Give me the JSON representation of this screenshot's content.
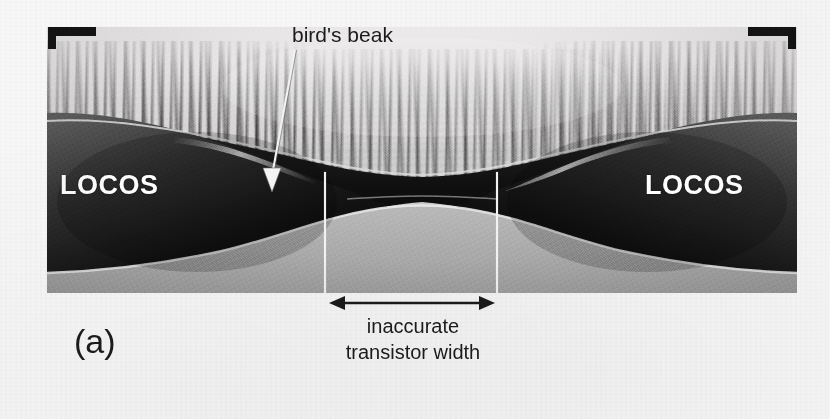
{
  "figure": {
    "panel_label": "(a)",
    "caption_lines": [
      "inaccurate",
      "transistor width"
    ],
    "annotations": {
      "birds_beak": "bird's beak",
      "locos_left": "LOCOS",
      "locos_right": "LOCOS"
    },
    "colors": {
      "page_background": "#f7f7f7",
      "annotation_text": "#1b1b1b",
      "label_text": "#ffffff",
      "guide_line": "#f2f2f2",
      "oxide_dark": "#161616",
      "substrate_gray": "#adadad",
      "top_light_layer": "#e9e7e7"
    },
    "micrograph": {
      "type": "cross-section-electron-micrograph",
      "subject": "LOCOS isolation bird's beak cross-section",
      "regions": [
        "top light encapsulation layer with columnar polysilicon grains",
        "dark thermal field oxide (LOCOS) bumps at left and right",
        "tapering bird's beak oxide encroachment",
        "light gray silicon substrate at bottom"
      ]
    },
    "measurements": {
      "guide_line_left_x": 325,
      "guide_line_right_x": 497,
      "dimension_arrow_y": 303,
      "dimension_arrow_from_x": 331,
      "dimension_arrow_to_x": 493
    }
  }
}
